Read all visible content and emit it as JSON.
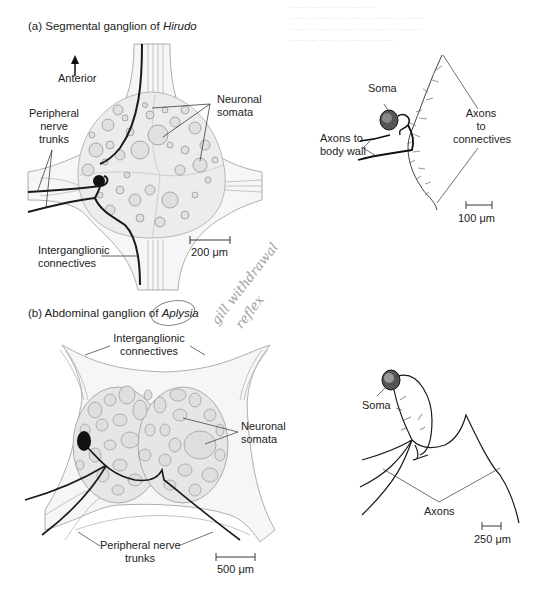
{
  "background_bleed_text": [
    "………… …… ………",
    "…… ………… …… ……… ………",
    "……… ………… ……… …………",
    "……… …… ………… ……"
  ],
  "panel_a": {
    "title_prefix": "(a) Segmental ganglion of ",
    "title_species": "Hirudo",
    "labels": {
      "anterior": "Anterior",
      "peripheral_nerve_trunks": [
        "Peripheral",
        "nerve",
        "trunks"
      ],
      "neuronal_somata": [
        "Neuronal",
        "somata"
      ],
      "interganglionic_connectives": [
        "Interganglionic",
        "connectives"
      ],
      "scale_bar": "200 μm"
    },
    "neuron": {
      "soma": "Soma",
      "axons_to_body_wall": [
        "Axons to",
        "body wall"
      ],
      "axons_to_connectives": [
        "Axons",
        "to",
        "connectives"
      ],
      "scale_bar": "100 μm"
    }
  },
  "panel_b": {
    "title_prefix": "(b) Abdominal ganglion of ",
    "title_species": "Aplysia",
    "labels": {
      "interganglionic_connectives": [
        "Interganglionic",
        "connectives"
      ],
      "neuronal_somata": [
        "Neuronal",
        "somata"
      ],
      "peripheral_nerve_trunks": [
        "Peripheral nerve",
        "trunks"
      ],
      "scale_bar": "500 μm"
    },
    "neuron": {
      "soma": "Soma",
      "axons": "Axons",
      "scale_bar": "250 μm"
    }
  },
  "handwritten_annotation": [
    "gill withdrawal",
    "reflex"
  ],
  "colors": {
    "ganglion_fill": "#ececec",
    "capsule_fill": "#f6f6f6",
    "soma_fill": "#dcdcdc",
    "ink": "#1a1a1a",
    "thin_line": "#8a8a8a"
  }
}
